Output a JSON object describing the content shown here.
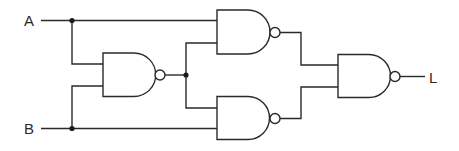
{
  "diagram": {
    "title": "",
    "type": "logic-circuit",
    "inputs": [
      {
        "id": "A",
        "label": "A"
      },
      {
        "id": "B",
        "label": "B"
      }
    ],
    "outputs": [
      {
        "id": "L",
        "label": "L"
      }
    ],
    "gates": [
      {
        "id": "G1",
        "type": "NAND",
        "inputs": [
          "A",
          "B"
        ]
      },
      {
        "id": "G2",
        "type": "NAND",
        "inputs": [
          "A",
          "G1"
        ]
      },
      {
        "id": "G3",
        "type": "NAND",
        "inputs": [
          "G1",
          "B"
        ]
      },
      {
        "id": "G4",
        "type": "NAND",
        "inputs": [
          "G2",
          "G3"
        ],
        "output": "L"
      }
    ],
    "colors": {
      "stroke": "#2a2a2a",
      "background": "#ffffff"
    }
  }
}
